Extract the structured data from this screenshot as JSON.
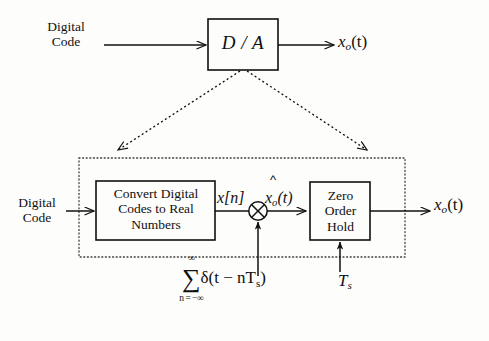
{
  "figure": {
    "type": "block-diagram"
  },
  "top_diagram": {
    "input_label": "Digital\nCode",
    "input_line1": "Digital",
    "input_line2": "Code",
    "block_label": "D / A",
    "output_label_base": "x",
    "output_label_sub": "o",
    "output_label_arg": "(t)"
  },
  "expansion": {
    "left_arrow": "dashed-expansion-arrow-left",
    "right_arrow": "dashed-expansion-arrow-right"
  },
  "bottom_diagram": {
    "input_line1": "Digital",
    "input_line2": "Code",
    "convert_block": {
      "line1": "Convert Digital",
      "line2": "Codes to Real",
      "line3": "Numbers"
    },
    "signal_xn_base": "x",
    "signal_xn_index": "[n]",
    "signal_xo_hat_base": "x",
    "signal_xo_hat_sub": "o",
    "signal_xo_hat_arg": "(t)",
    "hat_accent": "^",
    "multiplier_symbol": "⊗",
    "zoh_block": {
      "line1": "Zero",
      "line2": "Order",
      "line3": "Hold"
    },
    "output_label_base": "x",
    "output_label_sub": "o",
    "output_label_arg": "(t)"
  },
  "formulas": {
    "impulse_train": {
      "sum_upper_limit": "∞",
      "sum_lower_limit": "n = −∞",
      "sigma": "∑",
      "expression": "δ(t − nT",
      "expression_sub": "s",
      "expression_close": ")"
    },
    "sampling_period": {
      "base": "T",
      "sub": "s"
    }
  },
  "colors": {
    "background": "#fdfdfc",
    "ink": "#101010",
    "dotted_border": "#4a4a4a"
  }
}
